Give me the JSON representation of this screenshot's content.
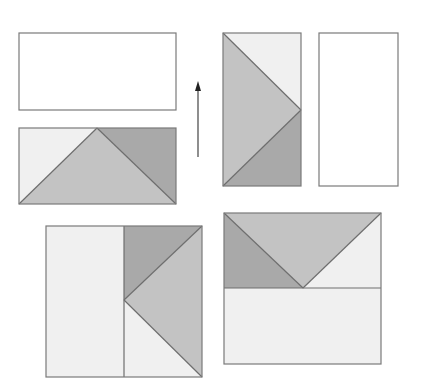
{
  "diagram": {
    "colors": {
      "light": "#f0f0f0",
      "medium": "#c3c3c3",
      "dark": "#a9a9a9",
      "border": "#7a7a7a",
      "arrow": "#333333"
    },
    "figures": [
      {
        "id": "top-left-rectangle",
        "shape": "rectangle",
        "fill": "light"
      },
      {
        "id": "lower-left-rectangle",
        "pieces": [
          "light triangle left",
          "medium triangle center",
          "dark triangle right"
        ]
      },
      {
        "id": "up-arrow",
        "direction": "up"
      },
      {
        "id": "tall-rectangle-with-triangles",
        "pieces": [
          "light triangle top-right",
          "medium triangle left",
          "dark triangle bottom-right"
        ]
      },
      {
        "id": "tall-plain-rectangle",
        "shape": "rectangle",
        "fill": "light"
      },
      {
        "id": "bottom-left-square",
        "pieces": [
          "light rectangle left half",
          "dark triangle top",
          "medium triangle right",
          "light triangle bottom"
        ]
      },
      {
        "id": "bottom-right-square",
        "pieces": [
          "dark triangle left",
          "medium triangle top",
          "light triangle right",
          "light rectangle bottom half"
        ]
      }
    ]
  }
}
